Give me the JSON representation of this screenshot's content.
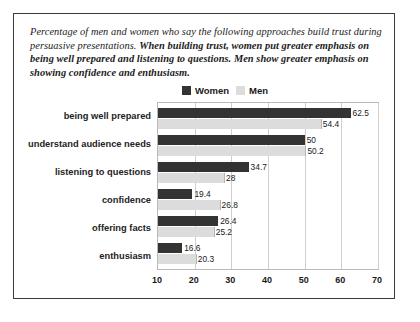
{
  "caption": {
    "plain": "Percentage of men and women who say the following approaches build trust during persuasive presentations. ",
    "bold": "When building trust, women put greater emphasis on being well prepared and listening to questions. Men show greater emphasis on showing confidence and enthusiasm."
  },
  "legend": {
    "women_label": "Women",
    "men_label": "Men",
    "women_color": "#333333",
    "men_color": "#dcdcdc"
  },
  "chart_data": {
    "type": "bar",
    "orientation": "horizontal",
    "title": "",
    "xlabel": "",
    "ylabel": "",
    "xlim": [
      10,
      70
    ],
    "xticks": [
      10,
      20,
      30,
      40,
      50,
      60,
      70
    ],
    "grid": true,
    "legend_position": "top-center",
    "categories": [
      "being well prepared",
      "understand audience needs",
      "listening to questions",
      "confidence",
      "offering facts",
      "enthusiasm"
    ],
    "series": [
      {
        "name": "Women",
        "color": "#333333",
        "values": [
          62.5,
          50,
          34.7,
          19.4,
          26.4,
          16.6
        ]
      },
      {
        "name": "Men",
        "color": "#dcdcdc",
        "values": [
          54.4,
          50.2,
          28,
          26.8,
          25.2,
          20.3
        ]
      }
    ],
    "value_labels": [
      [
        "62.5",
        "54.4"
      ],
      [
        "50",
        "50.2"
      ],
      [
        "34.7",
        "28"
      ],
      [
        "19.4",
        "26.8"
      ],
      [
        "26.4",
        "25.2"
      ],
      [
        "16.6",
        "20.3"
      ]
    ]
  }
}
